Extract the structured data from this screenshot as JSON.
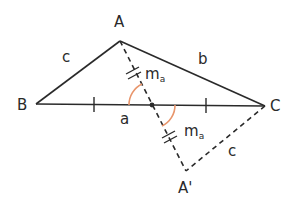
{
  "diagram": {
    "colors": {
      "line": "#2a2a2a",
      "arc": "#e8956b",
      "background": "#ffffff"
    },
    "points": {
      "A": {
        "label": "A",
        "x": 120,
        "y": 41
      },
      "B": {
        "label": "B",
        "x": 36,
        "y": 104
      },
      "C": {
        "label": "C",
        "x": 265,
        "y": 106
      },
      "M": {
        "label": "",
        "x": 152,
        "y": 105
      },
      "A2": {
        "label": "A'",
        "x": 186,
        "y": 171
      }
    },
    "sides": {
      "c": {
        "label": "c"
      },
      "b": {
        "label": "b"
      },
      "a": {
        "label": "a"
      },
      "c2": {
        "label": "c"
      }
    },
    "median": {
      "label_main": "m",
      "label_sub": "a"
    }
  }
}
